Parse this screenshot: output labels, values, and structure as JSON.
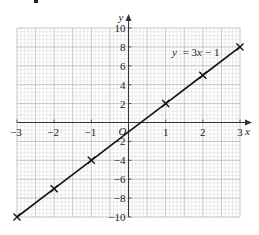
{
  "chart_data": {
    "type": "line",
    "title": "",
    "equation_label": "y = 3x − 1",
    "xlabel": "x",
    "ylabel": "y",
    "origin_label": "O",
    "xlim": [
      -3,
      3
    ],
    "ylim": [
      -10,
      10
    ],
    "grid": true,
    "x_ticks": [
      -3,
      -2,
      -1,
      1,
      2,
      3
    ],
    "x_tick_labels": [
      "−3",
      "−2",
      "−1",
      "1",
      "2",
      "3"
    ],
    "y_ticks": [
      10,
      8,
      6,
      4,
      2,
      -2,
      -4,
      -6,
      -8,
      -10
    ],
    "y_tick_labels": [
      "10",
      "8",
      "6",
      "4",
      "2",
      "−2",
      "−4",
      "−6",
      "−8",
      "−10"
    ],
    "series": [
      {
        "name": "y = 3x − 1",
        "x": [
          -3,
          -2,
          -1,
          0,
          1,
          2,
          3
        ],
        "values": [
          -10,
          -7,
          -4,
          -1,
          2,
          5,
          8
        ],
        "marker": "x",
        "color": "#111111"
      }
    ]
  },
  "colors": {
    "minor_grid": "#d9d9d9",
    "major_grid": "#b5b5b5",
    "axis": "#333333",
    "line": "#111111"
  }
}
